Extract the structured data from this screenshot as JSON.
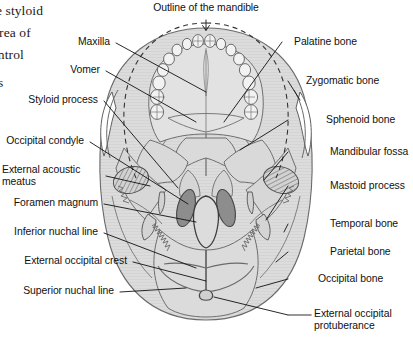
{
  "figure": {
    "name": "inferior-view-of-skull-diagram",
    "colors": {
      "bone_fill": "#dcdcdc",
      "bone_fill_light": "#e6e6e6",
      "bone_stroke": "#6e6e6e",
      "outline_stroke": "#555555",
      "condyle_fill": "#8d8d8d",
      "condyle_stroke": "#4a4a4a",
      "leader_line": "#111111",
      "dashed_outline": "#333333",
      "text": "#111111",
      "page_background": "#ffffff"
    }
  },
  "page_text": {
    "fragment_line_1": "e styloid",
    "fragment_line_2": "area of",
    "fragment_line_3": "ontrol",
    "fragment_line_4": "s"
  },
  "labels": {
    "top": [
      {
        "id": "outline-of-the-mandible",
        "text": "Outline of the mandible"
      }
    ],
    "left": [
      {
        "id": "maxilla",
        "text": "Maxilla"
      },
      {
        "id": "vomer",
        "text": "Vomer"
      },
      {
        "id": "styloid-process",
        "text": "Styloid process"
      },
      {
        "id": "occipital-condyle",
        "text": "Occipital condyle"
      },
      {
        "id": "external-acoustic-meatus",
        "text": "External acoustic meatus"
      },
      {
        "id": "foramen-magnum",
        "text": "Foramen magnum"
      },
      {
        "id": "inferior-nuchal-line",
        "text": "Inferior nuchal line"
      },
      {
        "id": "external-occipital-crest",
        "text": "External occipital crest"
      },
      {
        "id": "superior-nuchal-line",
        "text": "Superior nuchal line"
      }
    ],
    "right": [
      {
        "id": "palatine-bone",
        "text": "Palatine bone"
      },
      {
        "id": "zygomatic-bone",
        "text": "Zygomatic bone"
      },
      {
        "id": "sphenoid-bone",
        "text": "Sphenoid bone"
      },
      {
        "id": "mandibular-fossa",
        "text": "Mandibular fossa"
      },
      {
        "id": "mastoid-process",
        "text": "Mastoid process"
      },
      {
        "id": "temporal-bone",
        "text": "Temporal bone"
      },
      {
        "id": "parietal-bone",
        "text": "Parietal bone"
      },
      {
        "id": "occipital-bone",
        "text": "Occipital bone"
      },
      {
        "id": "external-occipital-protuberance",
        "text": "External occipital protuberance"
      }
    ]
  }
}
